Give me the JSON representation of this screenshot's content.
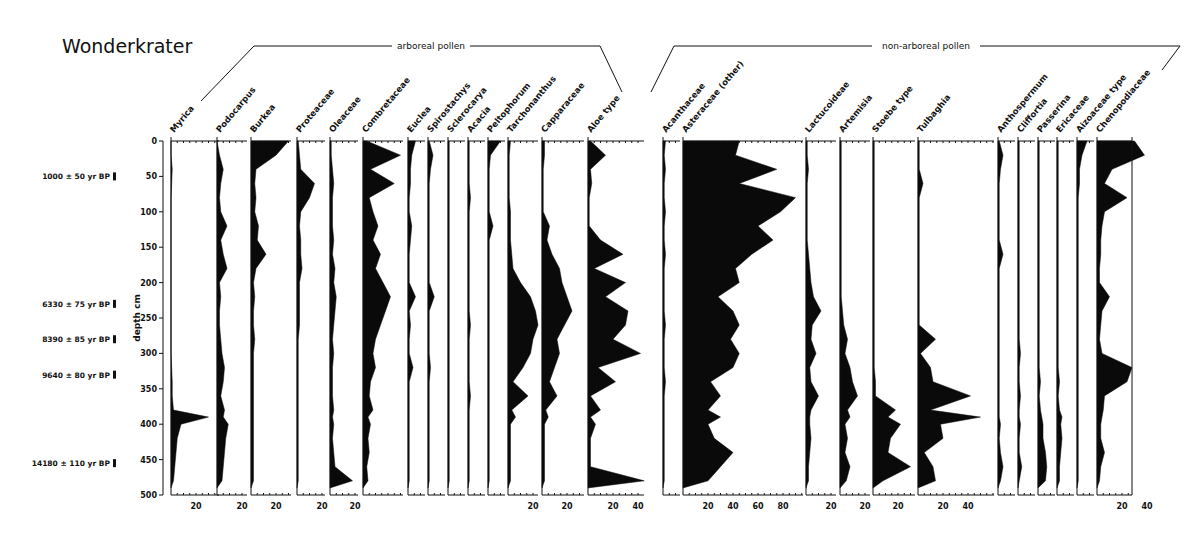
{
  "chart_data": {
    "type": "area",
    "subtype": "pollen-stratigraphic-diagram",
    "title": "Wonderkrater",
    "ylabel": "depth cm",
    "ylim": [
      0,
      500
    ],
    "y_ticks": [
      0,
      50,
      100,
      150,
      200,
      250,
      300,
      350,
      400,
      450,
      500
    ],
    "xlabel": "pollen percentage",
    "groups": [
      {
        "name": "arboreal pollen",
        "taxa_from": "Myrica",
        "taxa_to": "Capparaceae"
      },
      {
        "name": "non-arboreal pollen",
        "taxa_from": "Aloe type",
        "taxa_to": "Chenopodiaceae"
      }
    ],
    "radiocarbon_dates": [
      {
        "label": "1000 ± 50 yr BP",
        "depth": 50
      },
      {
        "label": "6330 ± 75 yr BP",
        "depth": 230
      },
      {
        "label": "8390 ± 85 yr BP",
        "depth": 280
      },
      {
        "label": "9640 ± 80 yr BP",
        "depth": 330
      },
      {
        "label": "14180 ± 110 yr BP",
        "depth": 455
      }
    ],
    "depths": [
      0,
      20,
      40,
      60,
      80,
      100,
      120,
      140,
      160,
      180,
      200,
      220,
      240,
      260,
      280,
      300,
      320,
      340,
      360,
      380,
      390,
      400,
      420,
      440,
      460,
      480,
      490
    ],
    "series": [
      {
        "name": "Myrica",
        "x": 171,
        "width": 48,
        "ticks": [
          20
        ],
        "values": [
          0,
          0,
          1,
          0.5,
          0,
          0,
          0,
          0,
          0,
          0,
          0,
          0,
          0,
          0,
          0,
          0,
          0.5,
          1,
          1,
          2,
          30,
          8,
          5,
          4,
          3,
          2,
          0
        ]
      },
      {
        "name": "Podocarpus",
        "x": 217,
        "width": 30,
        "ticks": [
          20
        ],
        "values": [
          0,
          2,
          5,
          3,
          2,
          3,
          8,
          3,
          5,
          8,
          2,
          3,
          2,
          2,
          3,
          4,
          6,
          5,
          3,
          6,
          5,
          9,
          7,
          6,
          5,
          4,
          0
        ]
      },
      {
        "name": "Burkea",
        "x": 251,
        "width": 40,
        "ticks": [
          20
        ],
        "values": [
          30,
          20,
          4,
          3,
          4,
          3,
          6,
          5,
          12,
          4,
          2,
          3,
          2,
          2,
          3,
          2,
          2,
          2,
          2,
          2,
          2,
          2,
          2,
          2,
          2,
          2,
          0
        ]
      },
      {
        "name": "Proteaceae",
        "x": 297,
        "width": 28,
        "ticks": [
          20
        ],
        "values": [
          1,
          2,
          3,
          14,
          10,
          3,
          2,
          3,
          3,
          4,
          2,
          2,
          2,
          2,
          1,
          1,
          1,
          1,
          1,
          1,
          1,
          1,
          1,
          1,
          1,
          1,
          0
        ]
      },
      {
        "name": "Oleaceae",
        "x": 330,
        "width": 28,
        "ticks": [
          20
        ],
        "values": [
          1,
          1,
          2,
          3,
          2,
          2,
          2,
          3,
          2,
          4,
          3,
          5,
          4,
          3,
          2,
          3,
          2,
          2,
          2,
          3,
          2,
          3,
          2,
          3,
          4,
          18,
          0
        ]
      },
      {
        "name": "Combretaceae",
        "x": 363,
        "width": 40,
        "ticks": [],
        "values": [
          3,
          30,
          6,
          25,
          5,
          8,
          12,
          8,
          14,
          10,
          16,
          22,
          18,
          14,
          10,
          8,
          10,
          6,
          5,
          8,
          4,
          6,
          4,
          5,
          3,
          4,
          0
        ]
      },
      {
        "name": "Euclea",
        "x": 408,
        "width": 17,
        "ticks": [],
        "values": [
          6,
          3,
          2,
          2,
          1,
          1,
          3,
          2,
          1,
          1,
          1,
          6,
          1,
          2,
          1,
          1,
          4,
          1,
          1,
          1,
          1,
          1,
          1,
          1,
          1,
          1,
          0
        ]
      },
      {
        "name": "Spirostachys",
        "x": 428,
        "width": 17,
        "ticks": [],
        "values": [
          1,
          4,
          2,
          1,
          1,
          1,
          1,
          1,
          1,
          1,
          1,
          5,
          1,
          1,
          1,
          1,
          2,
          1,
          1,
          1,
          1,
          1,
          1,
          1,
          1,
          1,
          0
        ]
      },
      {
        "name": "Sclerocarya",
        "x": 448,
        "width": 17,
        "ticks": [],
        "values": [
          1,
          1,
          1,
          1,
          1,
          1,
          1,
          1,
          1,
          1,
          1,
          1,
          1,
          1,
          1,
          1,
          1,
          1,
          1,
          1,
          1,
          1,
          1,
          1,
          1,
          1,
          0
        ]
      },
      {
        "name": "Acacia",
        "x": 468,
        "width": 17,
        "ticks": [],
        "values": [
          1,
          1,
          1,
          1,
          2,
          1,
          1,
          1,
          1,
          1,
          1,
          1,
          1,
          2,
          1,
          1,
          1,
          1,
          2,
          1,
          1,
          1,
          1,
          1,
          1,
          1,
          0
        ]
      },
      {
        "name": "Peltophorum",
        "x": 488,
        "width": 17,
        "ticks": [],
        "values": [
          10,
          2,
          1,
          1,
          1,
          1,
          4,
          1,
          1,
          1,
          1,
          1,
          1,
          1,
          1,
          1,
          1,
          1,
          1,
          1,
          1,
          1,
          1,
          1,
          1,
          1,
          0
        ]
      },
      {
        "name": "Tarchonanthus",
        "x": 508,
        "width": 30,
        "ticks": [
          20
        ],
        "values": [
          2,
          1,
          1,
          1,
          1,
          2,
          2,
          2,
          3,
          4,
          10,
          18,
          22,
          24,
          20,
          18,
          12,
          4,
          16,
          3,
          6,
          2,
          2,
          2,
          2,
          2,
          0
        ]
      },
      {
        "name": "Capparaceae",
        "x": 542,
        "width": 42,
        "ticks": [
          20
        ],
        "values": [
          2,
          2,
          1,
          1,
          1,
          1,
          6,
          4,
          8,
          14,
          16,
          20,
          24,
          18,
          12,
          14,
          10,
          6,
          12,
          3,
          5,
          2,
          2,
          2,
          2,
          2,
          0
        ]
      },
      {
        "name": "Aloe type",
        "x": 588,
        "width": 56,
        "ticks": [
          20,
          40
        ],
        "values": [
          2,
          14,
          2,
          3,
          1,
          1,
          1,
          10,
          28,
          5,
          30,
          14,
          32,
          30,
          20,
          42,
          8,
          22,
          2,
          10,
          2,
          6,
          2,
          2,
          2,
          45,
          0
        ]
      },
      {
        "name": "Acanthaceae",
        "x": 663,
        "width": 17,
        "ticks": [],
        "values": [
          2,
          1,
          2,
          1,
          1,
          2,
          1,
          1,
          2,
          1,
          1,
          1,
          1,
          2,
          1,
          1,
          1,
          2,
          1,
          1,
          1,
          1,
          1,
          1,
          1,
          1,
          0
        ]
      },
      {
        "name": "Asteraceae (other)",
        "x": 683,
        "width": 120,
        "ticks": [
          20,
          40,
          60,
          80
        ],
        "values": [
          45,
          42,
          75,
          45,
          90,
          78,
          60,
          72,
          55,
          42,
          45,
          28,
          40,
          45,
          38,
          45,
          40,
          22,
          30,
          20,
          30,
          20,
          25,
          40,
          30,
          20,
          0
        ]
      },
      {
        "name": "Lactucoideae",
        "x": 806,
        "width": 30,
        "ticks": [
          20
        ],
        "values": [
          1,
          1,
          2,
          1,
          1,
          1,
          1,
          1,
          2,
          3,
          4,
          6,
          12,
          5,
          4,
          8,
          3,
          4,
          10,
          4,
          3,
          3,
          4,
          3,
          2,
          2,
          0
        ]
      },
      {
        "name": "Artemisia",
        "x": 840,
        "width": 30,
        "ticks": [
          20
        ],
        "values": [
          1,
          1,
          1,
          1,
          1,
          1,
          1,
          1,
          1,
          1,
          1,
          1,
          2,
          3,
          6,
          4,
          8,
          10,
          14,
          6,
          8,
          4,
          6,
          4,
          8,
          5,
          0
        ]
      },
      {
        "name": "Stoebe type",
        "x": 873,
        "width": 42,
        "ticks": [
          20
        ],
        "values": [
          1,
          1,
          1,
          1,
          1,
          1,
          1,
          1,
          1,
          1,
          1,
          1,
          1,
          1,
          1,
          1,
          1,
          2,
          2,
          18,
          12,
          22,
          14,
          12,
          30,
          8,
          0
        ]
      },
      {
        "name": "Tulbaghia",
        "x": 918,
        "width": 76,
        "ticks": [
          20,
          40
        ],
        "values": [
          1,
          1,
          1,
          4,
          1,
          1,
          1,
          1,
          1,
          1,
          1,
          1,
          1,
          1,
          14,
          2,
          10,
          12,
          42,
          10,
          50,
          18,
          20,
          5,
          12,
          14,
          0
        ]
      },
      {
        "name": "Anthospermum",
        "x": 998,
        "width": 17,
        "ticks": [],
        "values": [
          1,
          4,
          2,
          1,
          1,
          1,
          1,
          1,
          4,
          1,
          1,
          1,
          1,
          1,
          1,
          1,
          1,
          1,
          1,
          1,
          1,
          2,
          1,
          2,
          4,
          2,
          0
        ]
      },
      {
        "name": "Cliffortia",
        "x": 1018,
        "width": 17,
        "ticks": [],
        "values": [
          1,
          1,
          1,
          1,
          1,
          1,
          1,
          1,
          1,
          1,
          1,
          1,
          1,
          1,
          1,
          2,
          1,
          1,
          2,
          1,
          1,
          2,
          1,
          1,
          3,
          1,
          0
        ]
      },
      {
        "name": "Passerina",
        "x": 1038,
        "width": 17,
        "ticks": [],
        "values": [
          1,
          1,
          1,
          1,
          1,
          1,
          1,
          1,
          1,
          1,
          1,
          1,
          1,
          1,
          1,
          1,
          1,
          2,
          1,
          2,
          3,
          4,
          4,
          6,
          7,
          6,
          0
        ]
      },
      {
        "name": "Ericaceae",
        "x": 1057,
        "width": 17,
        "ticks": [],
        "values": [
          1,
          1,
          1,
          1,
          1,
          1,
          1,
          1,
          1,
          1,
          1,
          1,
          1,
          1,
          1,
          1,
          1,
          2,
          1,
          2,
          4,
          3,
          4,
          3,
          2,
          2,
          0
        ]
      },
      {
        "name": "Aizoaceae type",
        "x": 1077,
        "width": 17,
        "ticks": [],
        "values": [
          8,
          4,
          2,
          2,
          1,
          1,
          1,
          1,
          1,
          1,
          1,
          1,
          1,
          1,
          1,
          1,
          1,
          1,
          1,
          1,
          1,
          1,
          1,
          1,
          1,
          1,
          0
        ]
      },
      {
        "name": "Chenopodiaceae",
        "x": 1097,
        "width": 35,
        "ticks": [
          20,
          40
        ],
        "values": [
          30,
          38,
          12,
          6,
          24,
          6,
          4,
          3,
          3,
          2,
          2,
          10,
          4,
          3,
          2,
          4,
          28,
          24,
          6,
          5,
          4,
          3,
          3,
          6,
          3,
          2,
          0
        ]
      }
    ]
  }
}
